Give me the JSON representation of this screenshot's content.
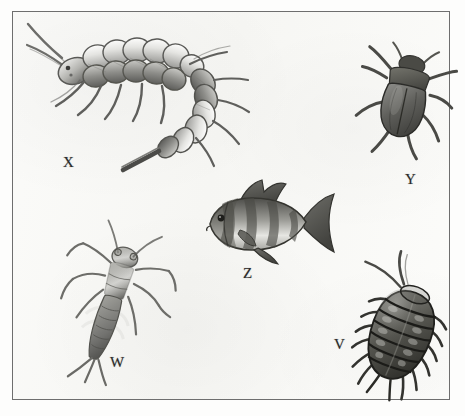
{
  "plate": {
    "title": "Aquatic organisms identification plate",
    "description": "Grayscale pencil-style scientific illustration of five aquatic organisms on an off-white paper background enclosed by a thin rectangular frame.",
    "background_color": "#fafaf8",
    "frame_color": "#6e6e6e",
    "ink_color": "#2b2b2b",
    "width": 465,
    "height": 416
  },
  "specimens": [
    {
      "label": "X",
      "name": "alderfly-larva",
      "common_name": "Alderfly / dobsonfly larva",
      "position": "upper-left",
      "description": "Large curved segmented aquatic insect larva with long antennae, six legs, lateral abdominal filaments and a pointed terminal filament",
      "orientation": "head upper-left, abdomen curving down to the right"
    },
    {
      "label": "Y",
      "name": "water-beetle",
      "common_name": "Adult water beetle",
      "position": "upper-right",
      "description": "Oval dark-bodied beetle with hardened elytra, visible pronotum, antennae and six legs",
      "orientation": "head up, body angled slightly right"
    },
    {
      "label": "Z",
      "name": "banded-fish",
      "common_name": "Fish (banded sunfish/perch type)",
      "position": "center",
      "description": "Deep-bodied fish with dark vertical bands, dorsal fin, pectoral and pelvic fins, and forked caudal fin",
      "orientation": "facing left"
    },
    {
      "label": "W",
      "name": "mayfly-nymph",
      "common_name": "Mayfly / stonefly nymph",
      "position": "lower-left",
      "description": "Slender elongated nymph with long antennae, sprawling legs, segmented abdomen and three terminal tail filaments (cerci)",
      "orientation": "head upper-right, tail lower-left"
    },
    {
      "label": "V",
      "name": "aquatic-sowbug",
      "common_name": "Aquatic sowbug / isopod",
      "position": "lower-right",
      "description": "Flattened oval isopod with many body segments, lateral spiny legs and long antennae",
      "orientation": "head upper-left, body angled down-right"
    }
  ]
}
